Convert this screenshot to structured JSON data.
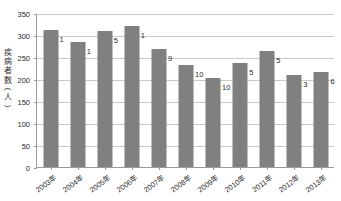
{
  "chart_data": {
    "type": "bar",
    "title": "",
    "subtitle": "",
    "xlabel": "",
    "ylabel": "疾病者数(人)",
    "ylabel_chars": [
      "疾",
      "病",
      "者",
      "数",
      "(",
      "人",
      ")"
    ],
    "categories": [
      "2003年",
      "2004年",
      "2005年",
      "2006年",
      "2007年",
      "2008年",
      "2009年",
      "2010年",
      "2011年",
      "2012年",
      "2013年"
    ],
    "values": [
      311,
      285,
      310,
      321,
      268,
      231,
      202,
      236,
      264,
      210,
      215
    ],
    "point_labels": [
      "1",
      "1",
      "5",
      "1",
      "9",
      "10",
      "10",
      "5",
      "5",
      "3",
      "6"
    ],
    "ylim": [
      0,
      350
    ],
    "yticks": [
      0,
      50,
      100,
      150,
      200,
      250,
      300,
      350
    ],
    "ytick_labels": [
      "0",
      "50",
      "100",
      "150",
      "200",
      "250",
      "300",
      "350"
    ],
    "grid": true,
    "legend": "none",
    "bar_color": "#808080",
    "grid_color": "#c9c9c9",
    "axis_color": "#9a9a9a",
    "text_color": "#2b2b2b"
  }
}
